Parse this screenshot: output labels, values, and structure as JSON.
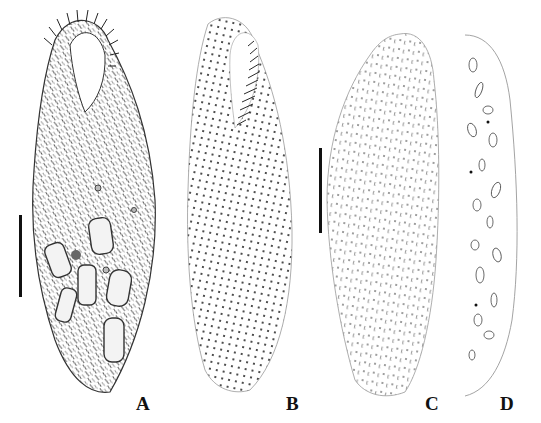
{
  "figure": {
    "panels": [
      {
        "id": "A",
        "label": "A",
        "description": "ciliate, ventral view, detailed cilia and food vacuoles"
      },
      {
        "id": "B",
        "label": "B",
        "description": "ventral infraciliature, kineties and adoral zone"
      },
      {
        "id": "C",
        "label": "C",
        "description": "dorsal infraciliature"
      },
      {
        "id": "D",
        "label": "D",
        "description": "macronuclear fragments"
      }
    ],
    "scale_bars": [
      {
        "panel": "A",
        "x": 19,
        "y_top": 215,
        "y_bottom": 297
      },
      {
        "panel": "C",
        "x": 319,
        "y_top": 148,
        "y_bottom": 233
      }
    ],
    "colors": {
      "ink": "#111111",
      "outline": "#888888",
      "background": "#ffffff"
    }
  }
}
